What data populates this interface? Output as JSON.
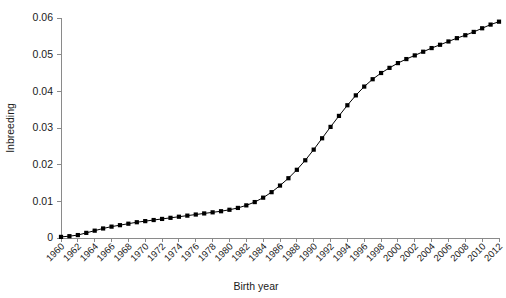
{
  "chart_data": {
    "type": "line",
    "title": "",
    "xlabel": "Birth year",
    "ylabel": "Inbreeding",
    "xlim": [
      1960,
      2012
    ],
    "ylim": [
      0,
      0.06
    ],
    "grid": false,
    "legend": null,
    "marker": "filled-square",
    "line_color": "#000000",
    "marker_color": "#000000",
    "axis_color": "#8a8a8a",
    "background_color": "#ffffff",
    "ytick_labels": [
      "0",
      "0.01",
      "0.02",
      "0.03",
      "0.04",
      "0.05",
      "0.06"
    ],
    "ytick_values": [
      0,
      0.01,
      0.02,
      0.03,
      0.04,
      0.05,
      0.06
    ],
    "xtick_labels": [
      "1960",
      "1962",
      "1964",
      "1966",
      "1968",
      "1970",
      "1972",
      "1974",
      "1976",
      "1978",
      "1980",
      "1982",
      "1984",
      "1986",
      "1988",
      "1990",
      "1992",
      "1994",
      "1996",
      "1998",
      "2000",
      "2002",
      "2004",
      "2006",
      "2008",
      "2010",
      "2012"
    ],
    "xtick_values": [
      1960,
      1962,
      1964,
      1966,
      1968,
      1970,
      1972,
      1974,
      1976,
      1978,
      1980,
      1982,
      1984,
      1986,
      1988,
      1990,
      1992,
      1994,
      1996,
      1998,
      2000,
      2002,
      2004,
      2006,
      2008,
      2010,
      2012
    ],
    "x": [
      1960,
      1961,
      1962,
      1963,
      1964,
      1965,
      1966,
      1967,
      1968,
      1969,
      1970,
      1971,
      1972,
      1973,
      1974,
      1975,
      1976,
      1977,
      1978,
      1979,
      1980,
      1981,
      1982,
      1983,
      1984,
      1985,
      1986,
      1987,
      1988,
      1989,
      1990,
      1991,
      1992,
      1993,
      1994,
      1995,
      1996,
      1997,
      1998,
      1999,
      2000,
      2001,
      2002,
      2003,
      2004,
      2005,
      2006,
      2007,
      2008,
      2009,
      2010,
      2011,
      2012
    ],
    "values": [
      0.0003,
      0.0005,
      0.0008,
      0.0014,
      0.002,
      0.0026,
      0.0031,
      0.0035,
      0.0039,
      0.0043,
      0.0046,
      0.0049,
      0.0052,
      0.0055,
      0.0058,
      0.0061,
      0.0064,
      0.0067,
      0.007,
      0.0073,
      0.0077,
      0.0082,
      0.0089,
      0.0098,
      0.011,
      0.0125,
      0.0143,
      0.0163,
      0.0186,
      0.0212,
      0.0241,
      0.0272,
      0.0303,
      0.0333,
      0.0362,
      0.0389,
      0.0413,
      0.0433,
      0.045,
      0.0464,
      0.0477,
      0.0488,
      0.0498,
      0.0508,
      0.0518,
      0.0527,
      0.0536,
      0.0545,
      0.0553,
      0.0562,
      0.0572,
      0.0582,
      0.059
    ],
    "series": [
      {
        "name": "Inbreeding",
        "values": [
          0.0003,
          0.0005,
          0.0008,
          0.0014,
          0.002,
          0.0026,
          0.0031,
          0.0035,
          0.0039,
          0.0043,
          0.0046,
          0.0049,
          0.0052,
          0.0055,
          0.0058,
          0.0061,
          0.0064,
          0.0067,
          0.007,
          0.0073,
          0.0077,
          0.0082,
          0.0089,
          0.0098,
          0.011,
          0.0125,
          0.0143,
          0.0163,
          0.0186,
          0.0212,
          0.0241,
          0.0272,
          0.0303,
          0.0333,
          0.0362,
          0.0389,
          0.0413,
          0.0433,
          0.045,
          0.0464,
          0.0477,
          0.0488,
          0.0498,
          0.0508,
          0.0518,
          0.0527,
          0.0536,
          0.0545,
          0.0553,
          0.0562,
          0.0572,
          0.0582,
          0.059
        ]
      }
    ]
  }
}
